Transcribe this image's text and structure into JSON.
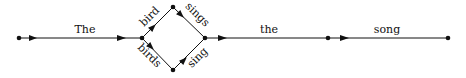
{
  "diagram": {
    "type": "word-lattice",
    "colors": {
      "line": "#111111",
      "background": "#ffffff"
    },
    "nodes": [
      {
        "id": "n0",
        "x": 19,
        "y": 38
      },
      {
        "id": "n1",
        "x": 142,
        "y": 38
      },
      {
        "id": "n2",
        "x": 173,
        "y": 7
      },
      {
        "id": "n3",
        "x": 173,
        "y": 70
      },
      {
        "id": "n4",
        "x": 205,
        "y": 38
      },
      {
        "id": "n5",
        "x": 328,
        "y": 38
      },
      {
        "id": "n6",
        "x": 448,
        "y": 38
      }
    ],
    "edges": [
      {
        "from": "n0",
        "to": "n1",
        "label": "The"
      },
      {
        "from": "n1",
        "to": "n2",
        "label": "bird"
      },
      {
        "from": "n1",
        "to": "n3",
        "label": "birds"
      },
      {
        "from": "n2",
        "to": "n4",
        "label": "sings"
      },
      {
        "from": "n3",
        "to": "n4",
        "label": "sing"
      },
      {
        "from": "n4",
        "to": "n5",
        "label": "the"
      },
      {
        "from": "n5",
        "to": "n6",
        "label": "song"
      }
    ]
  }
}
